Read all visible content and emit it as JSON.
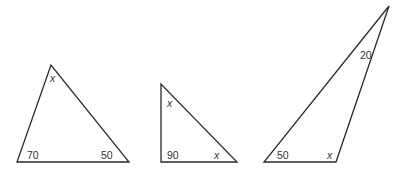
{
  "figure": {
    "colors": {
      "line": "#2a2a2a",
      "text": "#333333",
      "background": "#ffffff"
    },
    "triangles": [
      {
        "id": "triangle-1",
        "vertices": [
          [
            17,
            162
          ],
          [
            129,
            162
          ],
          [
            51,
            65
          ]
        ],
        "angles": {
          "bottom_left": "70",
          "bottom_right": "50",
          "top": "x"
        }
      },
      {
        "id": "triangle-2",
        "vertices": [
          [
            161,
            162
          ],
          [
            237,
            162
          ],
          [
            161,
            84
          ]
        ],
        "angles": {
          "bottom_left": "90",
          "bottom_right": "x",
          "top": "x"
        }
      },
      {
        "id": "triangle-3",
        "vertices": [
          [
            264,
            162
          ],
          [
            336,
            162
          ],
          [
            389,
            6
          ]
        ],
        "angles": {
          "bottom_left": "50",
          "bottom_right": "x",
          "top": "20"
        }
      }
    ]
  }
}
